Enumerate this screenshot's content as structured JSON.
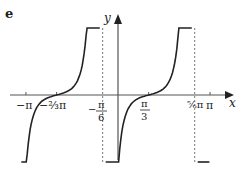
{
  "figure_label": "e",
  "chart_data": {
    "type": "line",
    "title": "",
    "xlabel": "x",
    "ylabel": "y",
    "function_shape": "tan-like cubic, period pi, flat inflection at roots",
    "xlim": [
      -3.6,
      3.5
    ],
    "roots": [
      -2.0944,
      1.0472
    ],
    "asymptotes": [
      -0.5236,
      2.618
    ],
    "x_ticks": [
      {
        "value": -3.1416,
        "label": "−π"
      },
      {
        "value": -2.0944,
        "label": "−⅔π"
      },
      {
        "value": 1.0472,
        "label": "π/3"
      },
      {
        "value": 3.1416,
        "label": "π"
      }
    ],
    "asymptote_labels": [
      {
        "value": -0.5236,
        "label_num": "π",
        "label_den": "6",
        "sign": "−"
      },
      {
        "value": 2.618,
        "label": "⅚π"
      }
    ],
    "series": [
      {
        "name": "branch-1",
        "x_range": [
          -3.3,
          -0.62
        ]
      },
      {
        "name": "branch-2",
        "x_range": [
          -0.42,
          2.52
        ]
      },
      {
        "name": "branch-3",
        "x_range": [
          2.72,
          3.12
        ]
      }
    ]
  }
}
